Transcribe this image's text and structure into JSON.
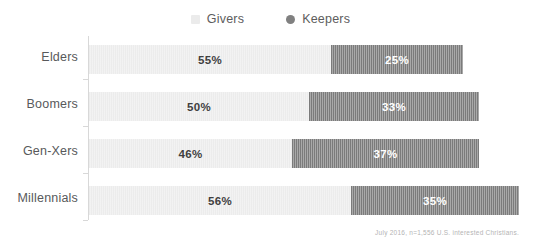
{
  "chart_data": {
    "type": "bar",
    "orientation": "horizontal",
    "stacked": true,
    "title": "",
    "xlabel": "",
    "ylabel": "",
    "grid": false,
    "legend_position": "top-center",
    "axis_max_percent": 100,
    "categories": [
      "Elders",
      "Boomers",
      "Gen-Xers",
      "Millennials"
    ],
    "series": [
      {
        "name": "Givers",
        "color": "#ececec",
        "values": [
          55,
          50,
          46,
          56
        ],
        "labels": [
          "55%",
          "50%",
          "46%",
          "56%"
        ]
      },
      {
        "name": "Keepers",
        "color": "#7b7b7b",
        "values": [
          25,
          33,
          37,
          35
        ],
        "labels": [
          "25%",
          "33%",
          "37%",
          "35%"
        ]
      }
    ],
    "annotations": [
      "July 2016, n=1,556 U.S. interested Christians."
    ]
  },
  "legend": {
    "items": [
      {
        "label": "Givers",
        "marker": "legend-swatch-givers",
        "color": "#ececec"
      },
      {
        "label": "Keepers",
        "marker": "legend-swatch-keepers",
        "color": "#7b7b7b"
      }
    ]
  },
  "rows": [
    {
      "category": "Elders",
      "givers_label": "55%",
      "keepers_label": "25%",
      "givers_width": "242px",
      "keepers_width": "132px"
    },
    {
      "category": "Boomers",
      "givers_label": "50%",
      "keepers_label": "33%",
      "givers_width": "220px",
      "keepers_width": "170px"
    },
    {
      "category": "Gen-Xers",
      "givers_label": "46%",
      "keepers_label": "37%",
      "givers_width": "203px",
      "keepers_width": "187px"
    },
    {
      "category": "Millennials",
      "givers_label": "56%",
      "keepers_label": "35%",
      "givers_width": "262px",
      "keepers_width": "168px"
    }
  ],
  "footnote": {
    "text": "July 2016, n=1,556 U.S. interested Christians."
  }
}
